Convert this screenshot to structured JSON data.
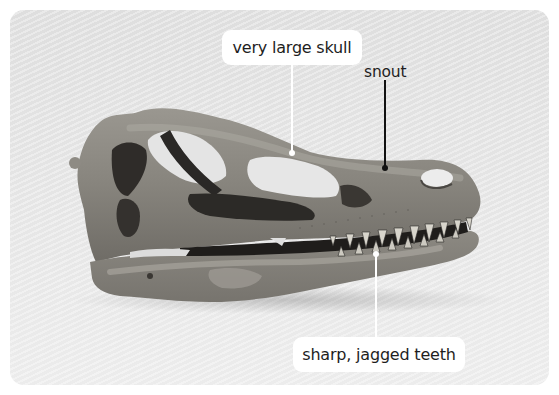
{
  "figure": {
    "background_color": "#e3e3e3",
    "labels": [
      {
        "id": "skull",
        "text": "very large skull",
        "style": "white-box",
        "leader_color": "#ffffff"
      },
      {
        "id": "snout",
        "text": "snout",
        "style": "plain",
        "leader_color": "#111111"
      },
      {
        "id": "teeth",
        "text": "sharp, jagged teeth",
        "style": "white-box",
        "leader_color": "#ffffff"
      }
    ]
  }
}
